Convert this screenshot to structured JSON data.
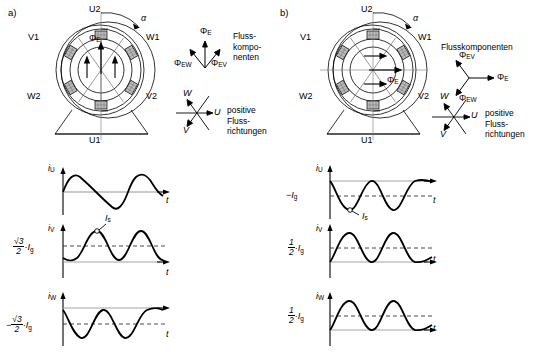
{
  "figure": {
    "line_color": "#000000",
    "hatch_color": "#9a9a9a",
    "dashed_color": "#444444"
  },
  "panels": [
    {
      "tag": "a)",
      "machine": {
        "terminals": [
          "U2",
          "V1",
          "W1",
          "W2",
          "V2",
          "U1"
        ],
        "angle_label": "α",
        "flux_label": "Φ",
        "flux_sub": "E",
        "flux_direction": "up"
      },
      "flux_components": {
        "caption": "Fluss-\nkompo-\nnenten",
        "vectors": [
          {
            "label": "Φ",
            "sub": "E",
            "name": "phi-e"
          },
          {
            "label": "Φ",
            "sub": "EW",
            "name": "phi-ew"
          },
          {
            "label": "Φ",
            "sub": "EV",
            "name": "phi-ev"
          }
        ]
      },
      "positive_directions": {
        "caption": "positive\nFluss-\nrichtungen",
        "axes": [
          "U",
          "V",
          "W"
        ]
      },
      "plots": [
        {
          "name": "plot-iu",
          "ylabel": "i",
          "ylabel_sub": "U",
          "xlabel": "t",
          "offset_label": null,
          "peak_label": null,
          "offset": 0.0,
          "amplitude": 1.0,
          "phase_deg": 0,
          "dashed_line": false
        },
        {
          "name": "plot-iv",
          "ylabel": "i",
          "ylabel_sub": "V",
          "xlabel": "t",
          "offset_label": {
            "sign": "",
            "num": "√3",
            "den": "2",
            "tail": "·I",
            "tail_sub": "g"
          },
          "peak_label": {
            "text": "I",
            "sub": "s"
          },
          "offset": 0.55,
          "amplitude": 0.62,
          "phase_deg": -40,
          "dashed_line": true
        },
        {
          "name": "plot-iw",
          "ylabel": "i",
          "ylabel_sub": "W",
          "xlabel": "t",
          "offset_label": {
            "sign": "−",
            "num": "√3",
            "den": "2",
            "tail": "·I",
            "tail_sub": "g"
          },
          "peak_label": null,
          "offset": -0.55,
          "amplitude": 0.62,
          "phase_deg": 40,
          "dashed_line": true
        }
      ]
    },
    {
      "tag": "b)",
      "machine": {
        "terminals": [
          "U2",
          "V1",
          "W1",
          "W2",
          "V2",
          "U1"
        ],
        "angle_label": "α",
        "flux_label": "Φ",
        "flux_sub": "E",
        "flux_direction": "right"
      },
      "flux_components": {
        "caption": "Flusskomponenten",
        "vectors": [
          {
            "label": "Φ",
            "sub": "E",
            "name": "phi-e"
          },
          {
            "label": "Φ",
            "sub": "EV",
            "name": "phi-ev"
          },
          {
            "label": "Φ",
            "sub": "EW",
            "name": "phi-ew"
          }
        ]
      },
      "positive_directions": {
        "caption": "positive\nFluss-\nrichtungen",
        "axes": [
          "U",
          "V",
          "W"
        ]
      },
      "plots": [
        {
          "name": "plot-iu",
          "ylabel": "i",
          "ylabel_sub": "U",
          "xlabel": "t",
          "offset_label": {
            "sign": "−",
            "num": null,
            "den": null,
            "tail": "I",
            "tail_sub": "g"
          },
          "peak_label": {
            "text": "I",
            "sub": "s"
          },
          "offset": -0.6,
          "amplitude": 0.62,
          "phase_deg": 180,
          "dashed_line": true
        },
        {
          "name": "plot-iv",
          "ylabel": "i",
          "ylabel_sub": "V",
          "xlabel": "t",
          "offset_label": {
            "sign": "",
            "num": "1",
            "den": "2",
            "tail": "·I",
            "tail_sub": "g"
          },
          "peak_label": null,
          "offset": 0.33,
          "amplitude": 0.62,
          "phase_deg": 0,
          "dashed_line": true
        },
        {
          "name": "plot-iw",
          "ylabel": "i",
          "ylabel_sub": "W",
          "xlabel": "t",
          "offset_label": {
            "sign": "",
            "num": "1",
            "den": "2",
            "tail": "·I",
            "tail_sub": "g"
          },
          "peak_label": null,
          "offset": 0.33,
          "amplitude": 0.62,
          "phase_deg": 0,
          "dashed_line": true
        }
      ]
    }
  ]
}
